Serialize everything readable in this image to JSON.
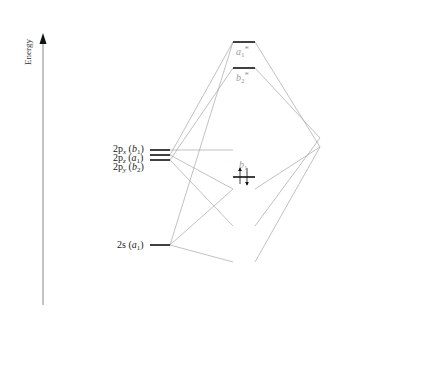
{
  "axis": {
    "label": "Energy"
  },
  "columns": {
    "left": "O",
    "center": "H₂O",
    "center_main": "H",
    "center_sub": "2",
    "center_tail": "O",
    "right": "H----H"
  },
  "oxygen_orbitals": [
    {
      "orb": "2p",
      "sub": "x",
      "sym": "b",
      "symsub": "1"
    },
    {
      "orb": "2p",
      "sub": "z",
      "sym": "a",
      "symsub": "1"
    },
    {
      "orb": "2p",
      "sub": "y",
      "sym": "b",
      "symsub": "2"
    },
    {
      "orb": "2s",
      "sub": "",
      "sym": "a",
      "symsub": "1"
    }
  ],
  "water_orbitals": [
    {
      "sym": "a",
      "sub": "1",
      "star": "*",
      "occupied": false
    },
    {
      "sym": "b",
      "sub": "2",
      "star": "*",
      "occupied": false
    },
    {
      "sym": "b",
      "sub": "1",
      "star": "",
      "occupied": true
    },
    {
      "sym": "a",
      "sub": "1",
      "star": "",
      "occupied": true
    },
    {
      "sym": "b",
      "sub": "2",
      "star": "",
      "occupied": true
    },
    {
      "sym": "a",
      "sub": "1",
      "star": "",
      "occupied": true
    }
  ],
  "hydrogen_group_orbitals": [
    {
      "sym": "b",
      "sub": "2"
    },
    {
      "sym": "a",
      "sub": "1"
    }
  ],
  "p_orbital_axes": {
    "x": "x",
    "z": "z",
    "y": "y"
  },
  "molecule": {
    "o": "O",
    "h1": "H",
    "h2": "H",
    "z_axis": "z",
    "y_axis": "y"
  },
  "colors": {
    "line": "#999999",
    "level": "#111111",
    "label_gray": "#9a9a9a",
    "text": "#222222",
    "lobe": "#c8c8c8"
  }
}
